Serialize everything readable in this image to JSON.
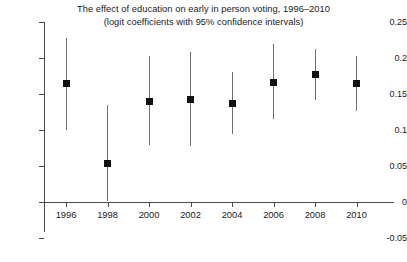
{
  "chart_data": {
    "type": "scatter",
    "title": "The effect of education on early in person voting, 1996–2010",
    "subtitle": "(logit coefficients with 95% confidence intervals)",
    "title_line1": "The effect of education on early in person voting, 1996–2010",
    "title_line2": "(logit coefficients with 95% confidence intervals)",
    "xlabel": "",
    "ylabel": "",
    "grid": false,
    "legend": "none",
    "ylim": [
      -0.05,
      0.25
    ],
    "ytick_labels": [
      "0.25",
      "0.2",
      "0.15",
      "0.1",
      "0.05",
      "0",
      "-0.05"
    ],
    "ytick_values": [
      0.25,
      0.2,
      0.15,
      0.1,
      0.05,
      0,
      -0.05
    ],
    "categories": [
      "1996",
      "1998",
      "2000",
      "2002",
      "2004",
      "2006",
      "2008",
      "2010"
    ],
    "x": [
      1996,
      1998,
      2000,
      2002,
      2004,
      2006,
      2008,
      2010
    ],
    "values": [
      0.165,
      0.054,
      0.14,
      0.143,
      0.137,
      0.166,
      0.177,
      0.165
    ],
    "ci_lower": [
      0.1,
      0.002,
      0.079,
      0.078,
      0.094,
      0.115,
      0.142,
      0.127
    ],
    "ci_upper": [
      0.228,
      0.135,
      0.203,
      0.208,
      0.18,
      0.219,
      0.212,
      0.203
    ],
    "series": [
      {
        "name": "logit coefficient",
        "values": [
          0.165,
          0.054,
          0.14,
          0.143,
          0.137,
          0.166,
          0.177,
          0.165
        ]
      }
    ],
    "points": [
      {
        "year": "1996",
        "estimate": 0.165,
        "low": 0.1,
        "high": 0.228
      },
      {
        "year": "1998",
        "estimate": 0.054,
        "low": 0.002,
        "high": 0.135
      },
      {
        "year": "2000",
        "estimate": 0.14,
        "low": 0.079,
        "high": 0.203
      },
      {
        "year": "2002",
        "estimate": 0.143,
        "low": 0.078,
        "high": 0.208
      },
      {
        "year": "2004",
        "estimate": 0.137,
        "low": 0.094,
        "high": 0.18
      },
      {
        "year": "2006",
        "estimate": 0.166,
        "low": 0.115,
        "high": 0.219
      },
      {
        "year": "2008",
        "estimate": 0.177,
        "low": 0.142,
        "high": 0.212
      },
      {
        "year": "2010",
        "estimate": 0.165,
        "low": 0.127,
        "high": 0.203
      }
    ],
    "colors": {
      "marker": "#111111",
      "whisker": "#6e6e6e",
      "axis": "#4a4a4a",
      "text": "#1a1a1a",
      "background": "#ffffff"
    }
  }
}
